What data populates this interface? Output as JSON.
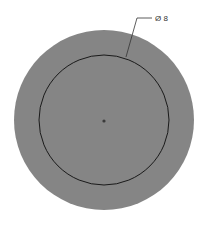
{
  "drawing": {
    "dimension_label": "Ø 8",
    "colors": {
      "background": "#ffffff",
      "outer_fill": "#858585",
      "inner_stroke": "#1a1a1a",
      "center_dot": "#3a3a3a",
      "leader_line": "#333333"
    },
    "outer_circle": {
      "cx": 104,
      "cy": 120,
      "r": 90
    },
    "inner_circle": {
      "cx": 104,
      "cy": 120,
      "r": 65
    },
    "center_point": {
      "cx": 104,
      "cy": 121,
      "r": 1.6
    }
  }
}
